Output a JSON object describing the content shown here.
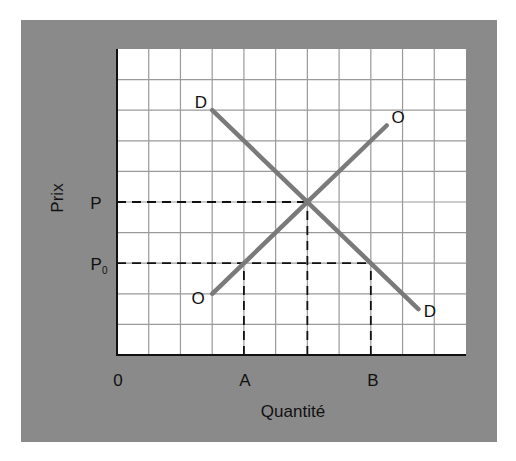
{
  "chart_data": {
    "type": "line",
    "title": "",
    "xlabel": "Quantité",
    "ylabel": "Prix",
    "grid": true,
    "grid_columns": 11,
    "grid_rows": 10,
    "xlim": [
      0,
      11
    ],
    "ylim": [
      0,
      10
    ],
    "x_tick_labels": [
      {
        "label": "0",
        "x": 0
      },
      {
        "label": "A",
        "x": 4
      },
      {
        "label": "B",
        "x": 8
      }
    ],
    "y_tick_labels": [
      {
        "label": "P",
        "y": 5
      },
      {
        "label": "P0",
        "y": 3
      }
    ],
    "series": [
      {
        "name": "D",
        "label_start": "D",
        "label_end": "D",
        "points": [
          [
            3,
            8
          ],
          [
            9.5,
            1.5
          ]
        ],
        "color": "#7a7a7a"
      },
      {
        "name": "O",
        "label_start": "O",
        "label_end": "O",
        "points": [
          [
            3,
            2
          ],
          [
            8.5,
            7.5
          ]
        ],
        "color": "#7a7a7a"
      }
    ],
    "equilibrium": {
      "x": 6,
      "y": 5
    },
    "reference_lines": [
      {
        "type": "dashed",
        "from": [
          0,
          5
        ],
        "to": [
          6,
          5
        ]
      },
      {
        "type": "dashed",
        "from": [
          6,
          0
        ],
        "to": [
          6,
          5
        ]
      },
      {
        "type": "dashed",
        "from": [
          0,
          3
        ],
        "to": [
          8,
          3
        ]
      },
      {
        "type": "dashed",
        "from": [
          4,
          0
        ],
        "to": [
          4,
          3
        ]
      },
      {
        "type": "dashed",
        "from": [
          8,
          0
        ],
        "to": [
          8,
          3
        ]
      }
    ]
  },
  "labels": {
    "ylabel": "Prix",
    "p": "P",
    "p0_main": "P",
    "p0_sub": "0",
    "origin": "0",
    "a": "A",
    "b": "B",
    "xlabel": "Quantité",
    "d_top": "D",
    "d_bottom": "D",
    "o_top": "O",
    "o_bottom": "O"
  },
  "colors": {
    "panel": "#8a8a8a",
    "grid": "#9a9a9a",
    "curves": "#7a7a7a",
    "axis": "#111111"
  }
}
